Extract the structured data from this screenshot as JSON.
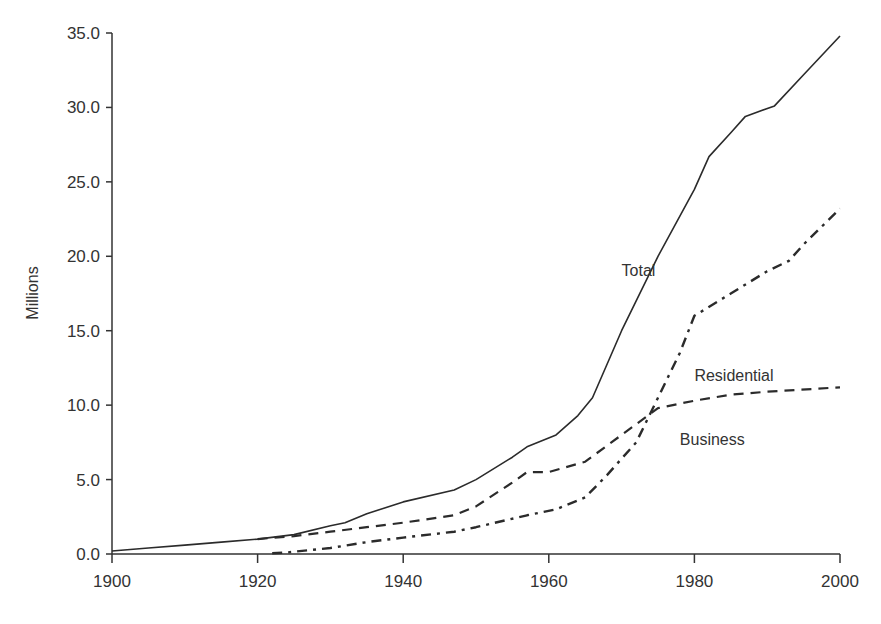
{
  "chart_data": {
    "type": "line",
    "title": "",
    "xlabel": "",
    "ylabel": "Millions",
    "xlim": [
      1900,
      2000
    ],
    "ylim": [
      0,
      35
    ],
    "x_ticks": [
      "1900",
      "1920",
      "1940",
      "1960",
      "1980",
      "2000"
    ],
    "y_ticks": [
      "0.0",
      "5.0",
      "10.0",
      "15.0",
      "20.0",
      "25.0",
      "30.0",
      "35.0"
    ],
    "grid": false,
    "legend": "inline labels",
    "series": [
      {
        "name": "Total",
        "style": "solid",
        "label_pos": [
          1970,
          18.7
        ],
        "x": [
          1900,
          1905,
          1910,
          1915,
          1920,
          1925,
          1930,
          1932,
          1935,
          1940,
          1947,
          1950,
          1955,
          1957,
          1961,
          1964,
          1966,
          1970,
          1975,
          1980,
          1982,
          1985,
          1987,
          1991,
          1995,
          2000
        ],
        "values": [
          0.2,
          0.4,
          0.6,
          0.8,
          1.0,
          1.3,
          1.9,
          2.1,
          2.7,
          3.5,
          4.3,
          5.0,
          6.5,
          7.2,
          8.0,
          9.3,
          10.5,
          15.0,
          20.0,
          24.5,
          26.7,
          28.3,
          29.4,
          30.1,
          32.2,
          34.8
        ]
      },
      {
        "name": "Residential",
        "style": "dash-dot",
        "label_pos": [
          1980,
          11.6
        ],
        "x": [
          1922,
          1924,
          1930,
          1935,
          1940,
          1947,
          1950,
          1957,
          1961,
          1965,
          1968,
          1970,
          1972,
          1975,
          1978,
          1980,
          1985,
          1990,
          1993,
          1995,
          2000
        ],
        "values": [
          0.05,
          0.1,
          0.4,
          0.8,
          1.1,
          1.5,
          1.8,
          2.6,
          3.0,
          3.8,
          5.3,
          6.4,
          7.5,
          10.5,
          13.5,
          16.0,
          17.5,
          19.0,
          19.7,
          20.8,
          23.2
        ]
      },
      {
        "name": "Business",
        "style": "dashed",
        "label_pos": [
          1978,
          7.3
        ],
        "x": [
          1920,
          1925,
          1930,
          1935,
          1940,
          1947,
          1950,
          1955,
          1957,
          1960,
          1965,
          1970,
          1975,
          1980,
          1985,
          1990,
          2000
        ],
        "values": [
          1.0,
          1.2,
          1.5,
          1.8,
          2.1,
          2.6,
          3.2,
          4.8,
          5.5,
          5.5,
          6.2,
          8.0,
          9.8,
          10.3,
          10.7,
          10.9,
          11.2
        ]
      }
    ]
  }
}
